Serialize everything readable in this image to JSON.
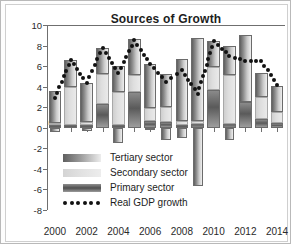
{
  "chart_data": {
    "type": "bar",
    "title": "Sources of Growth",
    "xlabel": "",
    "ylabel": "Percent",
    "ylim": [
      -8,
      10
    ],
    "ytick_step": 2,
    "yticks": [
      10,
      8,
      6,
      4,
      2,
      0,
      -2,
      -4,
      -6,
      -8
    ],
    "grid": false,
    "legend_position": "lower-left-inside",
    "stacked": true,
    "categories": [
      2000,
      2001,
      2002,
      2003,
      2004,
      2005,
      2006,
      2007,
      2008,
      2009,
      2010,
      2011,
      2012,
      2013,
      2014
    ],
    "xtick_labels": [
      "2000",
      "2002",
      "2004",
      "2006",
      "2008",
      "2010",
      "2012",
      "2014"
    ],
    "series": [
      {
        "name": "Primary sector",
        "color": "#6b6b6b",
        "values": [
          0.3,
          0.3,
          0.3,
          2.3,
          0.3,
          3.5,
          0.7,
          0.6,
          0.3,
          0.4,
          3.7,
          0.4,
          2.5,
          0.9,
          0.5
        ]
      },
      {
        "name": "Secondary sector",
        "color": "#dedede",
        "values": [
          0.2,
          3.7,
          0.3,
          2.9,
          3.2,
          1.6,
          1.2,
          1.4,
          0.4,
          0.3,
          2.2,
          4.7,
          -2.5,
          2.1,
          1.0
        ]
      },
      {
        "name": "Tertiary sector",
        "color": "#8c8c8c",
        "values": [
          3.1,
          2.6,
          3.8,
          2.6,
          2.5,
          3.5,
          4.3,
          3.2,
          6.0,
          8.0,
          2.5,
          2.9,
          6.5,
          2.3,
          2.6
        ]
      },
      {
        "name": "Primary sector (negative)",
        "color": "#6b6b6b",
        "values": [
          -0.4,
          0,
          -0.3,
          0,
          -1.5,
          0,
          -0.1,
          -1.2,
          -1.0,
          -5.7,
          0,
          -1.2,
          0,
          0,
          0
        ]
      }
    ],
    "line_series": {
      "name": "Real GDP growth",
      "style": "dotted",
      "color": "#111111",
      "values": [
        2.9,
        6.6,
        4.4,
        7.8,
        5.3,
        8.5,
        6.2,
        4.5,
        5.6,
        3.3,
        8.4,
        7.0,
        6.5,
        6.5,
        4.2
      ]
    }
  },
  "legend": {
    "items": [
      {
        "label": "Tertiary sector"
      },
      {
        "label": "Secondary sector"
      },
      {
        "label": "Primary sector"
      },
      {
        "label": "Real GDP growth"
      }
    ]
  }
}
